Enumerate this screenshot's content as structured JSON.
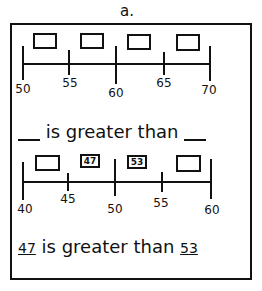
{
  "worksheet": {
    "title": "a.",
    "problem_1": {
      "number_line": {
        "ticks": [
          {
            "label": "50",
            "x": 23,
            "major": true
          },
          {
            "label": "55",
            "x": 68,
            "major": false
          },
          {
            "label": "60",
            "x": 116,
            "major": true
          },
          {
            "label": "65",
            "x": 164,
            "major": false
          },
          {
            "label": "70",
            "x": 209,
            "major": true
          }
        ]
      },
      "boxes": [
        {
          "value": "",
          "x": 33
        },
        {
          "value": "",
          "x": 80
        },
        {
          "value": "",
          "x": 127
        },
        {
          "value": "",
          "x": 176
        }
      ],
      "sentence": {
        "left_blank": "",
        "text": "is greater than",
        "right_blank": ""
      }
    },
    "problem_2": {
      "number_line": {
        "ticks": [
          {
            "label": "40",
            "x": 23,
            "major": true
          },
          {
            "label": "45",
            "x": 67,
            "major": false
          },
          {
            "label": "50",
            "x": 114,
            "major": true
          },
          {
            "label": "55",
            "x": 161,
            "major": false
          },
          {
            "label": "60",
            "x": 210,
            "major": true
          }
        ]
      },
      "boxes": [
        {
          "value": "",
          "x": 35
        },
        {
          "value": "47",
          "x": 80
        },
        {
          "value": "53",
          "x": 127
        },
        {
          "value": "",
          "x": 176
        }
      ],
      "sentence": {
        "left_answer": "47",
        "text": "is greater than",
        "right_answer": "53"
      }
    }
  }
}
